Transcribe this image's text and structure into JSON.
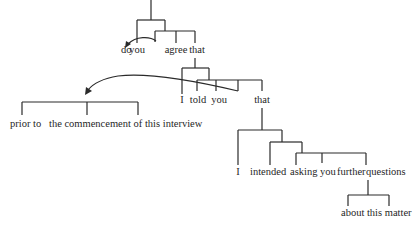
{
  "diagram": {
    "type": "syntax-tree",
    "colors": {
      "line": "#2a2a2a",
      "text": "#1f1f1f",
      "background": "#ffffff"
    },
    "words": {
      "do": "do",
      "you1": "you",
      "agree": "agree",
      "that1": "that",
      "prior_to": "prior to",
      "commencement": "the commencement of this interview",
      "i1": "I",
      "told": "told",
      "you2": "you",
      "that2": "that",
      "i2": "I",
      "intended": "intended",
      "asking": "asking",
      "you3": "you",
      "further": "further",
      "questions": "questions",
      "about": "about this matter"
    },
    "arrows": [
      {
        "name": "movement-arrow-do",
        "from": "agree-bracket",
        "to": "do"
      },
      {
        "name": "movement-arrow-prior-to",
        "from": "told-bracket",
        "to": "prior-to-phrase"
      }
    ]
  }
}
